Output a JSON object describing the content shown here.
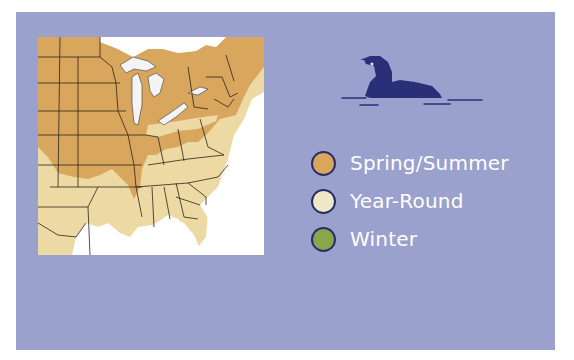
{
  "colors": {
    "background": "#9aa1cc",
    "spring_summer": "#d9a65e",
    "year_round": "#efe9c8",
    "winter": "#86a84a",
    "outline": "#2a2d66",
    "loon": "#2b2f78",
    "map_light": "#ecd9a3"
  },
  "icon": {
    "name": "loon-icon"
  },
  "map": {
    "name": "range-map",
    "region": "Eastern United States"
  },
  "legend": {
    "items": [
      {
        "label": "Spring/Summer",
        "color": "#d9a65e"
      },
      {
        "label": "Year-Round",
        "color": "#efe9c8"
      },
      {
        "label": "Winter",
        "color": "#86a84a"
      }
    ]
  }
}
